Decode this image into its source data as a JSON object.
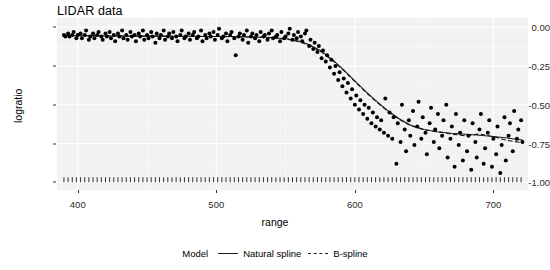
{
  "chart_data": {
    "type": "scatter",
    "title": "LIDAR data",
    "xlabel": "range",
    "ylabel": "logratio",
    "xlim": [
      385,
      725
    ],
    "ylim": [
      -1.05,
      0.06
    ],
    "xticks": [
      400,
      500,
      600,
      700
    ],
    "yticks": [
      0.0,
      -0.25,
      -0.5,
      -0.75,
      -1.0
    ],
    "ytick_labels": [
      "0.00",
      "-0.25",
      "-0.50",
      "-0.75",
      "-1.00"
    ],
    "xtick_labels": [
      "400",
      "500",
      "600",
      "700"
    ],
    "grid": true,
    "grid_color": "#ffffff",
    "panel_background": "#f2f2f2",
    "point_color": "#000000",
    "point_size": 3.1,
    "rug": {
      "present": true,
      "y": -1.0,
      "description": "tick marks along bottom axis at each range value"
    },
    "legend": {
      "title": "Model",
      "position": "bottom",
      "entries": [
        {
          "label": "Natural spline",
          "linestyle": "solid",
          "color": "#1a1a1a"
        },
        {
          "label": "B-spline",
          "linestyle": "dashed",
          "color": "#1a1a1a"
        }
      ]
    },
    "points": [
      [
        390.0,
        -0.05
      ],
      [
        391.0,
        -0.06
      ],
      [
        393.0,
        -0.04
      ],
      [
        394.0,
        -0.06
      ],
      [
        396.0,
        -0.05
      ],
      [
        397.0,
        -0.03
      ],
      [
        399.0,
        -0.07
      ],
      [
        400.0,
        -0.05
      ],
      [
        402.0,
        -0.04
      ],
      [
        403.0,
        -0.07
      ],
      [
        405.0,
        -0.05
      ],
      [
        406.0,
        -0.02
      ],
      [
        408.0,
        -0.08
      ],
      [
        409.0,
        -0.06
      ],
      [
        411.0,
        -0.04
      ],
      [
        412.0,
        -0.07
      ],
      [
        414.0,
        -0.05
      ],
      [
        415.0,
        -0.03
      ],
      [
        417.0,
        -0.06
      ],
      [
        418.0,
        -0.08
      ],
      [
        420.0,
        -0.04
      ],
      [
        421.0,
        -0.06
      ],
      [
        423.0,
        -0.03
      ],
      [
        424.0,
        -0.07
      ],
      [
        426.0,
        -0.05
      ],
      [
        427.0,
        -0.09
      ],
      [
        429.0,
        -0.04
      ],
      [
        430.0,
        -0.06
      ],
      [
        432.0,
        -0.02
      ],
      [
        433.0,
        -0.07
      ],
      [
        435.0,
        -0.05
      ],
      [
        436.0,
        -0.08
      ],
      [
        438.0,
        -0.03
      ],
      [
        439.0,
        -0.06
      ],
      [
        441.0,
        -0.05
      ],
      [
        442.0,
        -0.09
      ],
      [
        444.0,
        -0.04
      ],
      [
        445.0,
        -0.06
      ],
      [
        447.0,
        -0.02
      ],
      [
        448.0,
        -0.08
      ],
      [
        450.0,
        -0.05
      ],
      [
        451.0,
        -0.07
      ],
      [
        453.0,
        -0.03
      ],
      [
        454.0,
        -0.06
      ],
      [
        456.0,
        -0.1
      ],
      [
        457.0,
        -0.04
      ],
      [
        459.0,
        -0.07
      ],
      [
        460.0,
        -0.05
      ],
      [
        462.0,
        -0.02
      ],
      [
        463.0,
        -0.08
      ],
      [
        465.0,
        -0.06
      ],
      [
        466.0,
        -0.04
      ],
      [
        468.0,
        -0.07
      ],
      [
        469.0,
        -0.03
      ],
      [
        471.0,
        -0.06
      ],
      [
        472.0,
        -0.09
      ],
      [
        474.0,
        -0.05
      ],
      [
        475.0,
        -0.02
      ],
      [
        477.0,
        -0.07
      ],
      [
        478.0,
        -0.06
      ],
      [
        480.0,
        -0.04
      ],
      [
        481.0,
        -0.08
      ],
      [
        483.0,
        -0.05
      ],
      [
        484.0,
        -0.03
      ],
      [
        486.0,
        -0.07
      ],
      [
        487.0,
        -0.06
      ],
      [
        489.0,
        -0.02
      ],
      [
        490.0,
        -0.09
      ],
      [
        492.0,
        -0.05
      ],
      [
        493.0,
        -0.07
      ],
      [
        495.0,
        -0.04
      ],
      [
        496.0,
        -0.06
      ],
      [
        498.0,
        -0.03
      ],
      [
        499.0,
        -0.08
      ],
      [
        501.0,
        -0.05
      ],
      [
        502.0,
        -0.01
      ],
      [
        504.0,
        -0.07
      ],
      [
        505.0,
        -0.06
      ],
      [
        507.0,
        -0.04
      ],
      [
        508.0,
        -0.09
      ],
      [
        510.0,
        -0.05
      ],
      [
        511.0,
        -0.03
      ],
      [
        513.0,
        -0.07
      ],
      [
        514.0,
        -0.18
      ],
      [
        516.0,
        -0.06
      ],
      [
        517.0,
        -0.04
      ],
      [
        519.0,
        -0.08
      ],
      [
        520.0,
        -0.05
      ],
      [
        522.0,
        -0.02
      ],
      [
        523.0,
        -0.1
      ],
      [
        525.0,
        -0.06
      ],
      [
        526.0,
        -0.04
      ],
      [
        528.0,
        -0.07
      ],
      [
        529.0,
        -0.05
      ],
      [
        531.0,
        -0.09
      ],
      [
        532.0,
        -0.03
      ],
      [
        534.0,
        -0.06
      ],
      [
        535.0,
        -0.05
      ],
      [
        537.0,
        -0.08
      ],
      [
        538.0,
        -0.04
      ],
      [
        540.0,
        -0.02
      ],
      [
        541.0,
        -0.07
      ],
      [
        543.0,
        -0.06
      ],
      [
        544.0,
        -0.05
      ],
      [
        546.0,
        -0.09
      ],
      [
        547.0,
        -0.03
      ],
      [
        549.0,
        -0.07
      ],
      [
        550.0,
        -0.06
      ],
      [
        552.0,
        -0.04
      ],
      [
        553.0,
        -0.01
      ],
      [
        555.0,
        -0.08
      ],
      [
        556.0,
        -0.05
      ],
      [
        558.0,
        -0.07
      ],
      [
        559.0,
        -0.03
      ],
      [
        561.0,
        -0.06
      ],
      [
        562.0,
        -0.09
      ],
      [
        564.0,
        -0.04
      ],
      [
        565.0,
        -0.02
      ],
      [
        567.0,
        -0.12
      ],
      [
        568.0,
        -0.08
      ],
      [
        570.0,
        -0.14
      ],
      [
        571.0,
        -0.1
      ],
      [
        573.0,
        -0.16
      ],
      [
        574.0,
        -0.12
      ],
      [
        576.0,
        -0.2
      ],
      [
        577.0,
        -0.15
      ],
      [
        579.0,
        -0.22
      ],
      [
        580.0,
        -0.18
      ],
      [
        582.0,
        -0.26
      ],
      [
        583.0,
        -0.21
      ],
      [
        585.0,
        -0.3
      ],
      [
        586.0,
        -0.25
      ],
      [
        588.0,
        -0.34
      ],
      [
        589.0,
        -0.29
      ],
      [
        591.0,
        -0.38
      ],
      [
        592.0,
        -0.33
      ],
      [
        594.0,
        -0.42
      ],
      [
        595.0,
        -0.36
      ],
      [
        597.0,
        -0.46
      ],
      [
        598.0,
        -0.4
      ],
      [
        600.0,
        -0.5
      ],
      [
        601.0,
        -0.44
      ],
      [
        603.0,
        -0.53
      ],
      [
        604.0,
        -0.47
      ],
      [
        606.0,
        -0.56
      ],
      [
        607.0,
        -0.5
      ],
      [
        609.0,
        -0.59
      ],
      [
        610.0,
        -0.52
      ],
      [
        612.0,
        -0.62
      ],
      [
        613.0,
        -0.55
      ],
      [
        615.0,
        -0.64
      ],
      [
        616.0,
        -0.58
      ],
      [
        618.0,
        -0.66
      ],
      [
        619.0,
        -0.6
      ],
      [
        621.0,
        -0.68
      ],
      [
        622.0,
        -0.46
      ],
      [
        624.0,
        -0.7
      ],
      [
        625.0,
        -0.55
      ],
      [
        627.0,
        -0.72
      ],
      [
        628.0,
        -0.58
      ],
      [
        630.0,
        -0.88
      ],
      [
        631.0,
        -0.62
      ],
      [
        633.0,
        -0.74
      ],
      [
        634.0,
        -0.5
      ],
      [
        636.0,
        -0.66
      ],
      [
        637.0,
        -0.8
      ],
      [
        639.0,
        -0.6
      ],
      [
        640.0,
        -0.7
      ],
      [
        642.0,
        -0.54
      ],
      [
        643.0,
        -0.76
      ],
      [
        645.0,
        -0.64
      ],
      [
        646.0,
        -0.48
      ],
      [
        648.0,
        -0.72
      ],
      [
        649.0,
        -0.58
      ],
      [
        651.0,
        -0.68
      ],
      [
        652.0,
        -0.82
      ],
      [
        654.0,
        -0.62
      ],
      [
        655.0,
        -0.52
      ],
      [
        657.0,
        -0.74
      ],
      [
        658.0,
        -0.66
      ],
      [
        660.0,
        -0.56
      ],
      [
        661.0,
        -0.78
      ],
      [
        663.0,
        -0.7
      ],
      [
        664.0,
        -0.6
      ],
      [
        666.0,
        -0.5
      ],
      [
        667.0,
        -0.84
      ],
      [
        669.0,
        -0.72
      ],
      [
        670.0,
        -0.64
      ],
      [
        672.0,
        -0.9
      ],
      [
        673.0,
        -0.56
      ],
      [
        675.0,
        -0.76
      ],
      [
        676.0,
        -0.68
      ],
      [
        678.0,
        -0.86
      ],
      [
        679.0,
        -0.6
      ],
      [
        681.0,
        -0.8
      ],
      [
        682.0,
        -0.7
      ],
      [
        684.0,
        -0.92
      ],
      [
        685.0,
        -0.62
      ],
      [
        687.0,
        -0.74
      ],
      [
        688.0,
        -0.84
      ],
      [
        690.0,
        -0.66
      ],
      [
        691.0,
        -0.56
      ],
      [
        693.0,
        -0.88
      ],
      [
        694.0,
        -0.78
      ],
      [
        696.0,
        -0.68
      ],
      [
        697.0,
        -0.6
      ],
      [
        699.0,
        -0.9
      ],
      [
        700.0,
        -0.72
      ],
      [
        702.0,
        -0.82
      ],
      [
        703.0,
        -0.64
      ],
      [
        705.0,
        -0.94
      ],
      [
        706.0,
        -0.76
      ],
      [
        708.0,
        -0.58
      ],
      [
        709.0,
        -0.86
      ],
      [
        711.0,
        -0.7
      ],
      [
        712.0,
        -0.62
      ],
      [
        714.0,
        -0.8
      ],
      [
        715.0,
        -0.54
      ],
      [
        717.0,
        -0.72
      ],
      [
        718.0,
        -0.66
      ],
      [
        720.0,
        -0.6
      ],
      [
        721.0,
        -0.74
      ]
    ],
    "series": [
      {
        "name": "Natural spline",
        "linestyle": "solid",
        "color": "#1a1a1a",
        "x": [
          390,
          405,
          420,
          435,
          450,
          465,
          480,
          495,
          510,
          525,
          540,
          552,
          560,
          568,
          576,
          584,
          592,
          600,
          608,
          616,
          624,
          632,
          640,
          650,
          660,
          670,
          680,
          690,
          700,
          710,
          721
        ],
        "y": [
          -0.055,
          -0.055,
          -0.056,
          -0.056,
          -0.057,
          -0.058,
          -0.058,
          -0.059,
          -0.06,
          -0.062,
          -0.066,
          -0.075,
          -0.09,
          -0.115,
          -0.155,
          -0.21,
          -0.275,
          -0.345,
          -0.415,
          -0.48,
          -0.54,
          -0.59,
          -0.63,
          -0.66,
          -0.676,
          -0.684,
          -0.69,
          -0.697,
          -0.705,
          -0.715,
          -0.727
        ]
      },
      {
        "name": "B-spline",
        "linestyle": "dashed",
        "color": "#1a1a1a",
        "x": [
          390,
          405,
          420,
          435,
          450,
          465,
          480,
          495,
          510,
          525,
          540,
          552,
          560,
          568,
          576,
          584,
          592,
          600,
          608,
          616,
          624,
          632,
          640,
          650,
          660,
          670,
          680,
          690,
          700,
          710,
          721
        ],
        "y": [
          -0.052,
          -0.054,
          -0.055,
          -0.056,
          -0.057,
          -0.057,
          -0.058,
          -0.059,
          -0.061,
          -0.063,
          -0.068,
          -0.078,
          -0.094,
          -0.12,
          -0.16,
          -0.215,
          -0.28,
          -0.35,
          -0.42,
          -0.485,
          -0.545,
          -0.595,
          -0.634,
          -0.662,
          -0.673,
          -0.69,
          -0.7,
          -0.688,
          -0.706,
          -0.73,
          -0.745
        ]
      }
    ],
    "rug_x": [
      390,
      393,
      396,
      399,
      402,
      405,
      408,
      411,
      414,
      417,
      420,
      423,
      426,
      429,
      432,
      435,
      438,
      441,
      444,
      447,
      450,
      453,
      456,
      459,
      462,
      465,
      468,
      471,
      474,
      477,
      480,
      483,
      486,
      489,
      492,
      495,
      498,
      501,
      504,
      507,
      510,
      513,
      516,
      519,
      522,
      525,
      528,
      531,
      534,
      537,
      540,
      543,
      546,
      549,
      552,
      555,
      558,
      561,
      564,
      567,
      570,
      573,
      576,
      579,
      582,
      585,
      588,
      591,
      594,
      597,
      600,
      603,
      606,
      609,
      612,
      615,
      618,
      621,
      624,
      627,
      630,
      633,
      636,
      639,
      642,
      645,
      648,
      651,
      654,
      657,
      660,
      663,
      666,
      669,
      672,
      675,
      678,
      681,
      684,
      687,
      690,
      693,
      696,
      699,
      702,
      705,
      708,
      711,
      714,
      717,
      720
    ]
  }
}
